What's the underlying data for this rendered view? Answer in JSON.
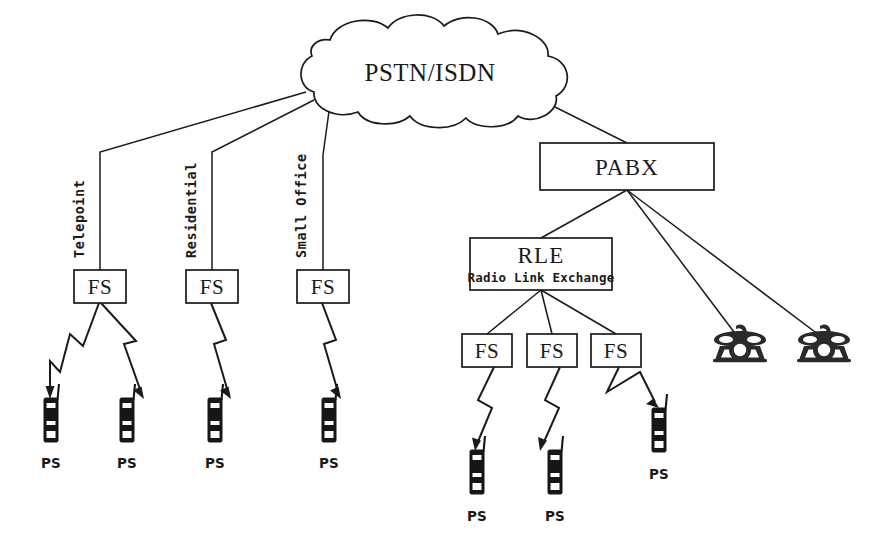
{
  "diagram": {
    "colors": {
      "ink": "#1a1a1a",
      "background": "#ffffff",
      "handset": "#161616"
    },
    "cloud": {
      "label": "PSTN/ISDN",
      "center_x": 430,
      "center_y": 72
    },
    "branch_labels": [
      {
        "id": "telepoint",
        "text": "Telepoint",
        "x": 84,
        "y": 258
      },
      {
        "id": "residential",
        "text": "Residential",
        "x": 196,
        "y": 258
      },
      {
        "id": "small-office",
        "text": "Small Office",
        "x": 306,
        "y": 258
      }
    ],
    "boxes": [
      {
        "id": "fs-telepoint",
        "label": "FS",
        "sub": "",
        "x": 74,
        "y": 270,
        "w": 52,
        "h": 33
      },
      {
        "id": "fs-residential",
        "label": "FS",
        "sub": "",
        "x": 186,
        "y": 270,
        "w": 52,
        "h": 33
      },
      {
        "id": "fs-smalloffice",
        "label": "FS",
        "sub": "",
        "x": 297,
        "y": 270,
        "w": 52,
        "h": 33
      },
      {
        "id": "pabx",
        "label": "PABX",
        "sub": "",
        "x": 540,
        "y": 143,
        "w": 174,
        "h": 47
      },
      {
        "id": "rle",
        "label": "RLE",
        "sub": "Radio Link Exchange",
        "x": 470,
        "y": 238,
        "w": 142,
        "h": 52
      },
      {
        "id": "fs-rle-1",
        "label": "FS",
        "sub": "",
        "x": 462,
        "y": 334,
        "w": 50,
        "h": 33
      },
      {
        "id": "fs-rle-2",
        "label": "FS",
        "sub": "",
        "x": 527,
        "y": 334,
        "w": 50,
        "h": 33
      },
      {
        "id": "fs-rle-3",
        "label": "FS",
        "sub": "",
        "x": 591,
        "y": 334,
        "w": 50,
        "h": 33
      }
    ],
    "handsets": [
      {
        "id": "ps-1",
        "label": "PS",
        "x": 44,
        "y": 396,
        "label_x": 51,
        "label_y": 468
      },
      {
        "id": "ps-2",
        "label": "PS",
        "x": 120,
        "y": 396,
        "label_x": 127,
        "label_y": 468
      },
      {
        "id": "ps-3",
        "label": "PS",
        "x": 208,
        "y": 396,
        "label_x": 215,
        "label_y": 468
      },
      {
        "id": "ps-4",
        "label": "PS",
        "x": 322,
        "y": 396,
        "label_x": 329,
        "label_y": 468
      },
      {
        "id": "ps-5",
        "label": "PS",
        "x": 470,
        "y": 448,
        "label_x": 477,
        "label_y": 521
      },
      {
        "id": "ps-6",
        "label": "PS",
        "x": 548,
        "y": 448,
        "label_x": 555,
        "label_y": 521
      },
      {
        "id": "ps-7",
        "label": "PS",
        "x": 652,
        "y": 406,
        "label_x": 659,
        "label_y": 479
      }
    ],
    "telephones": [
      {
        "id": "phone-1",
        "x": 740,
        "y": 348
      },
      {
        "id": "phone-2",
        "x": 824,
        "y": 348
      }
    ],
    "wired_links": [
      {
        "id": "cloud-to-fs-telepoint",
        "from": "PSTN/ISDN",
        "to": "FS Telepoint"
      },
      {
        "id": "cloud-to-fs-residential",
        "from": "PSTN/ISDN",
        "to": "FS Residential"
      },
      {
        "id": "cloud-to-fs-smalloffice",
        "from": "PSTN/ISDN",
        "to": "FS Small Office"
      },
      {
        "id": "cloud-to-pabx",
        "from": "PSTN/ISDN",
        "to": "PABX"
      },
      {
        "id": "pabx-to-rle",
        "from": "PABX",
        "to": "RLE"
      },
      {
        "id": "pabx-to-phone-1",
        "from": "PABX",
        "to": "Telephone 1"
      },
      {
        "id": "pabx-to-phone-2",
        "from": "PABX",
        "to": "Telephone 2"
      },
      {
        "id": "rle-to-fs-1",
        "from": "RLE",
        "to": "FS 1"
      },
      {
        "id": "rle-to-fs-2",
        "from": "RLE",
        "to": "FS 2"
      },
      {
        "id": "rle-to-fs-3",
        "from": "RLE",
        "to": "FS 3"
      }
    ],
    "radio_links": [
      {
        "id": "radio-fs-telepoint-ps1",
        "from": "FS Telepoint",
        "to": "PS"
      },
      {
        "id": "radio-fs-telepoint-ps2",
        "from": "FS Telepoint",
        "to": "PS"
      },
      {
        "id": "radio-fs-residential-ps3",
        "from": "FS Residential",
        "to": "PS"
      },
      {
        "id": "radio-fs-smalloffice-ps4",
        "from": "FS Small Office",
        "to": "PS"
      },
      {
        "id": "radio-fs-rle1-ps5",
        "from": "FS 1",
        "to": "PS"
      },
      {
        "id": "radio-fs-rle2-ps6",
        "from": "FS 2",
        "to": "PS"
      },
      {
        "id": "radio-fs-rle3-ps7",
        "from": "FS 3",
        "to": "PS"
      }
    ]
  }
}
